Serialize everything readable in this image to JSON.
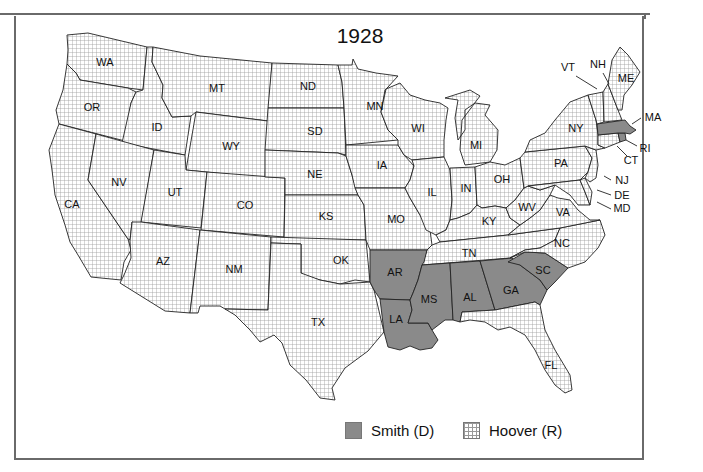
{
  "title": "1928",
  "colors": {
    "smith_fill": "#8a8a8a",
    "hoover_fill": "#ffffff",
    "hoover_grid": "#9a9a9a",
    "border": "#222222",
    "frame": "#6a6a6a"
  },
  "legend": {
    "items": [
      {
        "label": "Smith (D)",
        "pattern": "solid-gray"
      },
      {
        "label": "Hoover (R)",
        "pattern": "grid"
      }
    ]
  },
  "states": {
    "WA": {
      "label": "WA",
      "winner": "Hoover"
    },
    "OR": {
      "label": "OR",
      "winner": "Hoover"
    },
    "CA": {
      "label": "CA",
      "winner": "Hoover"
    },
    "ID": {
      "label": "ID",
      "winner": "Hoover"
    },
    "NV": {
      "label": "NV",
      "winner": "Hoover"
    },
    "MT": {
      "label": "MT",
      "winner": "Hoover"
    },
    "WY": {
      "label": "WY",
      "winner": "Hoover"
    },
    "UT": {
      "label": "UT",
      "winner": "Hoover"
    },
    "AZ": {
      "label": "AZ",
      "winner": "Hoover"
    },
    "CO": {
      "label": "CO",
      "winner": "Hoover"
    },
    "NM": {
      "label": "NM",
      "winner": "Hoover"
    },
    "ND": {
      "label": "ND",
      "winner": "Hoover"
    },
    "SD": {
      "label": "SD",
      "winner": "Hoover"
    },
    "NE": {
      "label": "NE",
      "winner": "Hoover"
    },
    "KS": {
      "label": "KS",
      "winner": "Hoover"
    },
    "OK": {
      "label": "OK",
      "winner": "Hoover"
    },
    "TX": {
      "label": "TX",
      "winner": "Hoover"
    },
    "MN": {
      "label": "MN",
      "winner": "Hoover"
    },
    "IA": {
      "label": "IA",
      "winner": "Hoover"
    },
    "MO": {
      "label": "MO",
      "winner": "Hoover"
    },
    "AR": {
      "label": "AR",
      "winner": "Smith"
    },
    "LA": {
      "label": "LA",
      "winner": "Smith"
    },
    "WI": {
      "label": "WI",
      "winner": "Hoover"
    },
    "IL": {
      "label": "IL",
      "winner": "Hoover"
    },
    "MI": {
      "label": "MI",
      "winner": "Hoover"
    },
    "IN": {
      "label": "IN",
      "winner": "Hoover"
    },
    "OH": {
      "label": "OH",
      "winner": "Hoover"
    },
    "KY": {
      "label": "KY",
      "winner": "Hoover"
    },
    "TN": {
      "label": "TN",
      "winner": "Hoover"
    },
    "MS": {
      "label": "MS",
      "winner": "Smith"
    },
    "AL": {
      "label": "AL",
      "winner": "Smith"
    },
    "GA": {
      "label": "GA",
      "winner": "Smith"
    },
    "FL": {
      "label": "FL",
      "winner": "Hoover"
    },
    "SC": {
      "label": "SC",
      "winner": "Smith"
    },
    "NC": {
      "label": "NC",
      "winner": "Hoover"
    },
    "VA": {
      "label": "VA",
      "winner": "Hoover"
    },
    "WV": {
      "label": "WV",
      "winner": "Hoover"
    },
    "PA": {
      "label": "PA",
      "winner": "Hoover"
    },
    "NY": {
      "label": "NY",
      "winner": "Hoover"
    },
    "VT": {
      "label": "VT",
      "winner": "Hoover"
    },
    "NH": {
      "label": "NH",
      "winner": "Hoover"
    },
    "ME": {
      "label": "ME",
      "winner": "Hoover"
    },
    "MA": {
      "label": "MA",
      "winner": "Smith"
    },
    "RI": {
      "label": "RI",
      "winner": "Smith"
    },
    "CT": {
      "label": "CT",
      "winner": "Hoover"
    },
    "NJ": {
      "label": "NJ",
      "winner": "Hoover"
    },
    "DE": {
      "label": "DE",
      "winner": "Hoover"
    },
    "MD": {
      "label": "MD",
      "winner": "Hoover"
    }
  }
}
